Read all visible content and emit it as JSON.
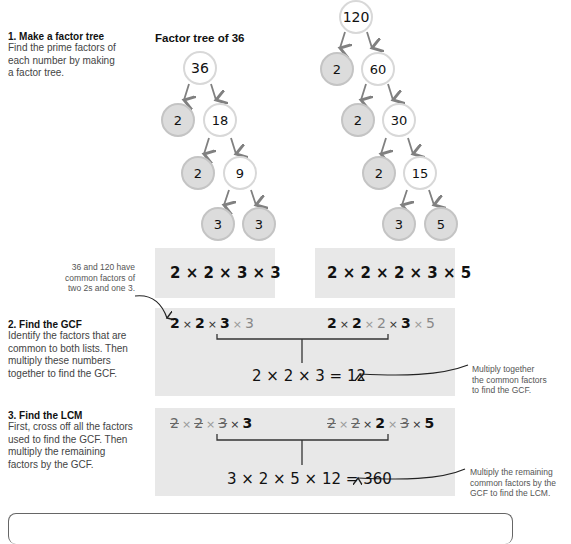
{
  "steps": [
    {
      "title": "1. Make a factor tree",
      "desc_lines": [
        "Find the prime factors of",
        "each number by making",
        "a factor tree."
      ]
    },
    {
      "title": "2. Find the GCF",
      "desc_lines": [
        "Identify the factors that are",
        "common to both lists. Then",
        "multiply these numbers",
        "together to find the GCF."
      ]
    },
    {
      "title": "3. Find the LCM",
      "desc_lines": [
        "First, cross off all the factors",
        "used to find the GCF. Then",
        "multiply the remaining",
        "factors by the GCF."
      ]
    }
  ],
  "tree36": {
    "title": "Factor tree of 36",
    "nodes": {
      "root": "36",
      "a": "2",
      "b": "18",
      "c": "2",
      "d": "9",
      "e": "3",
      "f": "3"
    }
  },
  "tree120": {
    "nodes": {
      "root": "120",
      "a": "2",
      "b": "60",
      "c": "2",
      "d": "30",
      "e": "2",
      "f": "15",
      "g": "3",
      "h": "5"
    }
  },
  "factor_lists": {
    "list36": "2 × 2 × 3 × 3",
    "list120": "2 × 2 × 2 × 3 × 5"
  },
  "gcf": {
    "list36": [
      {
        "v": "2",
        "s": "b"
      },
      {
        "v": "2",
        "s": "b"
      },
      {
        "v": "3",
        "s": "b"
      },
      {
        "v": "3",
        "s": "f"
      }
    ],
    "list120": [
      {
        "v": "2",
        "s": "b"
      },
      {
        "v": "2",
        "s": "b"
      },
      {
        "v": "2",
        "s": "f"
      },
      {
        "v": "3",
        "s": "b"
      },
      {
        "v": "5",
        "s": "f"
      }
    ],
    "result": "2 × 2 × 3 = 12"
  },
  "lcm": {
    "list36": [
      {
        "v": "2",
        "s": "s"
      },
      {
        "v": "2",
        "s": "s"
      },
      {
        "v": "3",
        "s": "s"
      },
      {
        "v": "3",
        "s": "b"
      }
    ],
    "list120": [
      {
        "v": "2",
        "s": "s"
      },
      {
        "v": "2",
        "s": "s"
      },
      {
        "v": "2",
        "s": "b"
      },
      {
        "v": "3",
        "s": "s"
      },
      {
        "v": "5",
        "s": "b"
      }
    ],
    "result": "3 × 2 × 5 × 12 = 360"
  },
  "notes": {
    "common": [
      "36 and 120 have",
      "common factors of",
      "two 2s and one 3."
    ],
    "gcf": [
      "Multiply together",
      "the common factors",
      "to find the GCF."
    ],
    "lcm": [
      "Multiply the remaining",
      "common factors by the",
      "GCF to find the LCM."
    ]
  },
  "colors": {
    "panel": "#e8e8e8",
    "node_gray": "#dcdcdc",
    "arrow": "#808080"
  }
}
